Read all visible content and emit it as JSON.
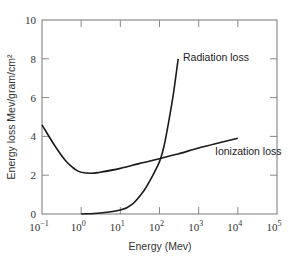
{
  "chart_data": {
    "type": "line",
    "title": "",
    "xlabel": "Energy (Mev)",
    "ylabel": "Energy loss Mev/gram/cm²",
    "xscale": "log",
    "xlim": [
      0.1,
      100000
    ],
    "ylim": [
      0,
      10
    ],
    "grid": false,
    "legend": "none (direct curve labels)",
    "x_ticks": [
      {
        "value": 0.1,
        "base": "10",
        "exp": "−1"
      },
      {
        "value": 1,
        "base": "10",
        "exp": "0"
      },
      {
        "value": 10,
        "base": "10",
        "exp": "1"
      },
      {
        "value": 100,
        "base": "10",
        "exp": "2"
      },
      {
        "value": 1000,
        "base": "10",
        "exp": "3"
      },
      {
        "value": 10000,
        "base": "10",
        "exp": "4"
      },
      {
        "value": 100000,
        "base": "10",
        "exp": "5"
      }
    ],
    "y_ticks": [
      0,
      2,
      4,
      6,
      8,
      10
    ],
    "series": [
      {
        "name": "Ionization loss",
        "x": [
          0.1,
          0.2,
          0.4,
          0.7,
          1.0,
          1.8,
          3.0,
          10,
          30,
          100,
          300,
          1000,
          3000,
          10000
        ],
        "y": [
          4.6,
          3.6,
          2.75,
          2.3,
          2.15,
          2.1,
          2.15,
          2.35,
          2.6,
          2.85,
          3.1,
          3.4,
          3.65,
          3.9
        ]
      },
      {
        "name": "Radiation loss",
        "x": [
          1.0,
          3.0,
          10,
          20,
          40,
          60,
          100,
          130,
          170,
          230,
          300
        ],
        "y": [
          0.0,
          0.05,
          0.2,
          0.5,
          1.2,
          1.8,
          2.7,
          3.5,
          4.7,
          6.3,
          8.0
        ]
      }
    ],
    "annotations": [
      {
        "text": "Radiation loss",
        "near": "top of radiation curve (~300 Mev, 8)"
      },
      {
        "text": "Ionization loss",
        "near": "right end of ionization curve (~10^4 Mev, 3.9)"
      }
    ]
  },
  "labels": {
    "xlabel": "Energy (Mev)",
    "ylabel": "Energy loss Mev/gram/cm²",
    "radiation": "Radiation loss",
    "ionization": "Ionization loss"
  }
}
